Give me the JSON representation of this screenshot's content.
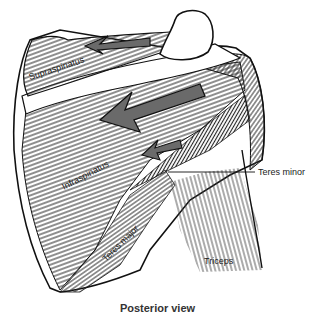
{
  "figure": {
    "caption": "Posterior view",
    "labels": {
      "supraspinatus": "Supraspinatus",
      "infraspinatus": "Infraspinatus",
      "teres_minor": "Teres minor",
      "teres_major": "Teres major",
      "triceps": "Triceps"
    },
    "colors": {
      "outline": "#111111",
      "hatch": "#333333",
      "arrow_fill": "#6a6a6a",
      "background": "#ffffff"
    },
    "arrows": [
      {
        "muscle": "supraspinatus",
        "direction": "left"
      },
      {
        "muscle": "infraspinatus",
        "direction": "down-left"
      },
      {
        "muscle": "teres_minor",
        "direction": "down-left"
      }
    ]
  }
}
